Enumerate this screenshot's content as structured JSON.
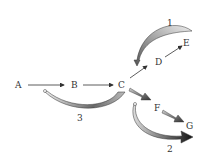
{
  "diagram": {
    "nodes": [
      {
        "id": "A",
        "label": "A"
      },
      {
        "id": "B",
        "label": "B"
      },
      {
        "id": "C",
        "label": "C"
      },
      {
        "id": "D",
        "label": "D"
      },
      {
        "id": "E",
        "label": "E"
      },
      {
        "id": "F",
        "label": "F"
      },
      {
        "id": "G",
        "label": "G"
      }
    ],
    "edges": [
      {
        "from": "A",
        "to": "B",
        "style": "thin"
      },
      {
        "from": "B",
        "to": "C",
        "style": "thin"
      },
      {
        "from": "C",
        "to": "D",
        "style": "thin"
      },
      {
        "from": "D",
        "to": "E",
        "style": "thin"
      },
      {
        "from": "C",
        "to": "F",
        "style": "thick"
      },
      {
        "from": "F",
        "to": "G",
        "style": "thick"
      }
    ],
    "curved_arrows": [
      {
        "label": "1",
        "from": "E",
        "to": "C-D",
        "shade": "light"
      },
      {
        "label": "2",
        "from": "F",
        "to": "G",
        "shade": "dark"
      },
      {
        "label": "3",
        "from": "C",
        "to": "A-B",
        "shade": "medium"
      }
    ]
  }
}
